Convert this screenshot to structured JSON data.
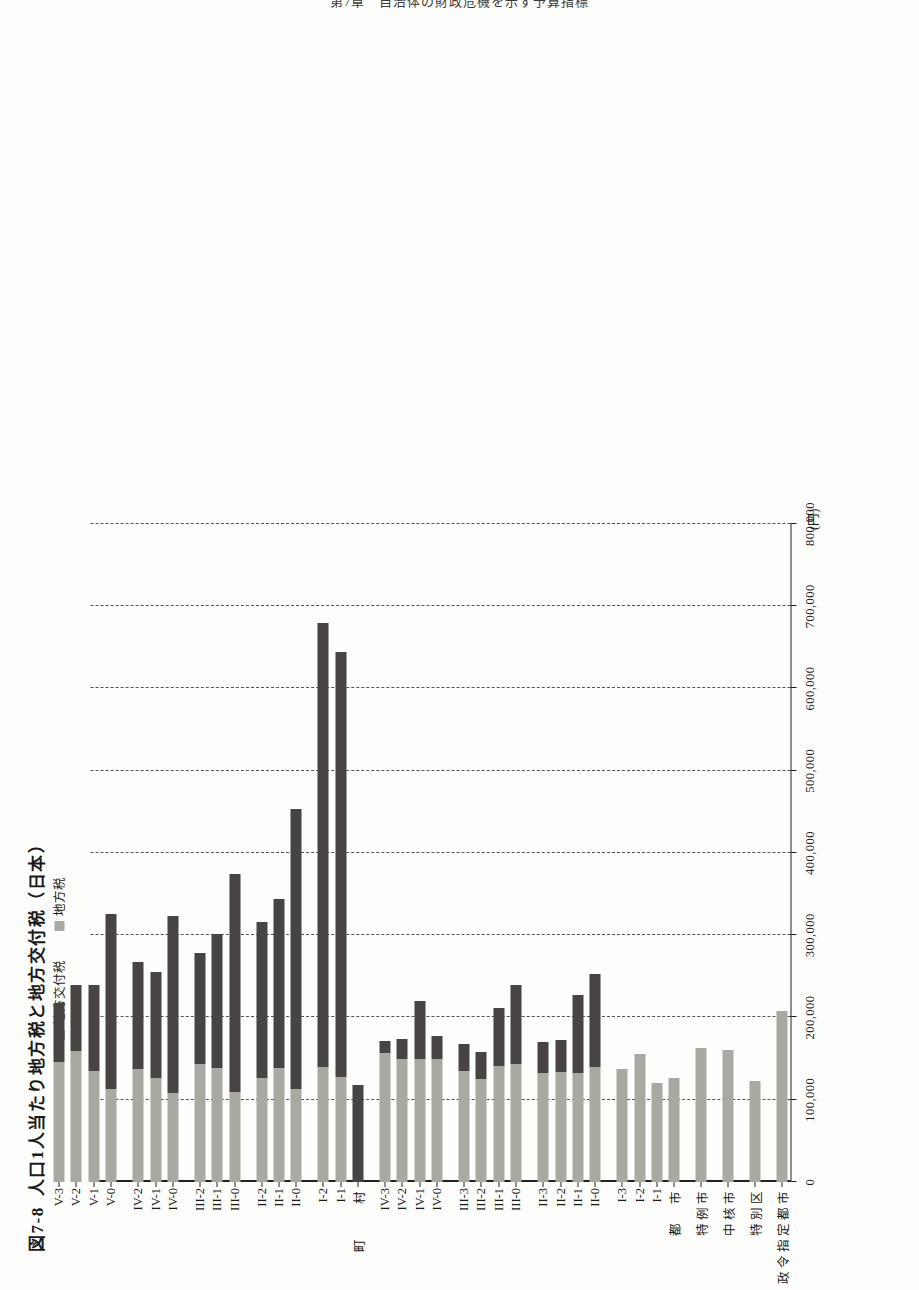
{
  "page": {
    "running_head": "第7章　自治体の財政危機を示す予算指標"
  },
  "figure": {
    "number": "図7-8",
    "title": "人口1人当たり地方税と地方交付税（日本）",
    "unit_label": "(円)"
  },
  "legend": {
    "position": "top-left",
    "items": [
      {
        "key": "grant",
        "label": "地方交付税",
        "color": "#474442"
      },
      {
        "key": "tax",
        "label": "地方税",
        "color": "#a9a9a4"
      }
    ]
  },
  "axis": {
    "value_ticks": [
      "0",
      "100,000",
      "200,000",
      "300,000",
      "400,000",
      "500,000",
      "600,000",
      "700,000",
      "800,000"
    ],
    "value_min": 0,
    "value_max": 800000,
    "value_step": 100000,
    "grid": "dashed"
  },
  "group_labels": [
    {
      "label": "政令指定都市",
      "at": 0
    },
    {
      "label": "特別区",
      "at": 1
    },
    {
      "label": "中核市",
      "at": 2
    },
    {
      "label": "特例市",
      "at": 3
    },
    {
      "label": "都　市",
      "at": 4
    },
    {
      "label": "町　　村",
      "at": 20
    }
  ],
  "chart_data": {
    "type": "bar",
    "orientation": "horizontal-stacked",
    "title": "人口1人当たり地方税と地方交付税（日本）",
    "xlabel": "",
    "ylabel": "(円)",
    "xlim": [
      0,
      800000
    ],
    "grid": true,
    "legend_position": "top-left",
    "series": [
      {
        "name": "地方税",
        "key": "tax",
        "color": "#a9a9a4"
      },
      {
        "name": "地方交付税",
        "key": "grant",
        "color": "#474442"
      }
    ],
    "categories": [
      "政令指定都市",
      "特別区",
      "中核市",
      "特例市",
      "I-0",
      "I-1",
      "I-2",
      "I-3",
      "II-0",
      "II-1",
      "II-2",
      "II-3",
      "III-0",
      "III-1",
      "III-2",
      "III-3",
      "IV-0",
      "IV-1",
      "IV-2",
      "IV-3",
      "I-0 ",
      "I-1 ",
      "I-2 ",
      "II-0 ",
      "II-1 ",
      "II-2 ",
      "III-0 ",
      "III-1 ",
      "III-2 ",
      "IV-0 ",
      "IV-1 ",
      "IV-2 ",
      "V-0",
      "V-1",
      "V-2",
      "V-3"
    ],
    "rows": [
      {
        "category": "政令指定都市",
        "tax": 208000,
        "grant": 0,
        "total": 208000,
        "group": "designated-city"
      },
      {
        "category": "特別区",
        "tax": 123000,
        "grant": 0,
        "total": 123000,
        "group": "special-ward"
      },
      {
        "category": "中核市",
        "tax": 161000,
        "grant": 0,
        "total": 161000,
        "group": "core-city"
      },
      {
        "category": "特例市",
        "tax": 163000,
        "grant": 0,
        "total": 163000,
        "group": "special-case-city"
      },
      {
        "category": "I-0",
        "tax": 127000,
        "grant": 0,
        "total": 127000,
        "group": "city"
      },
      {
        "category": "I-1",
        "tax": 120000,
        "grant": 0,
        "total": 120000,
        "group": "city"
      },
      {
        "category": "I-2",
        "tax": 156000,
        "grant": 0,
        "total": 156000,
        "group": "city"
      },
      {
        "category": "I-3",
        "tax": 137000,
        "grant": 0,
        "total": 137000,
        "group": "city"
      },
      {
        "category": "II-0",
        "tax": 140000,
        "grant": 113000,
        "total": 253000,
        "group": "city"
      },
      {
        "category": "II-1",
        "tax": 133000,
        "grant": 94000,
        "total": 227000,
        "group": "city"
      },
      {
        "category": "II-2",
        "tax": 134000,
        "grant": 39000,
        "total": 173000,
        "group": "city"
      },
      {
        "category": "II-3",
        "tax": 133000,
        "grant": 37000,
        "total": 170000,
        "group": "city"
      },
      {
        "category": "III-0",
        "tax": 143000,
        "grant": 96000,
        "total": 239000,
        "group": "city"
      },
      {
        "category": "III-1",
        "tax": 141000,
        "grant": 71000,
        "total": 212000,
        "group": "city"
      },
      {
        "category": "III-2",
        "tax": 125000,
        "grant": 33000,
        "total": 158000,
        "group": "city"
      },
      {
        "category": "III-3",
        "tax": 135000,
        "grant": 33000,
        "total": 168000,
        "group": "city"
      },
      {
        "category": "IV-0",
        "tax": 150000,
        "grant": 28000,
        "total": 178000,
        "group": "city"
      },
      {
        "category": "IV-1",
        "tax": 150000,
        "grant": 70000,
        "total": 220000,
        "group": "city"
      },
      {
        "category": "IV-2",
        "tax": 150000,
        "grant": 24000,
        "total": 174000,
        "group": "city"
      },
      {
        "category": "IV-3",
        "tax": 157000,
        "grant": 15000,
        "total": 172000,
        "group": "city"
      },
      {
        "category": "I-0",
        "tax": 0,
        "grant": 118000,
        "total": 118000,
        "group": "town-village"
      },
      {
        "category": "I-1",
        "tax": 128000,
        "grant": 517000,
        "total": 645000,
        "group": "town-village"
      },
      {
        "category": "I-2",
        "tax": 140000,
        "grant": 540000,
        "total": 680000,
        "group": "town-village"
      },
      {
        "category": "II-0",
        "tax": 113000,
        "grant": 340000,
        "total": 453000,
        "group": "town-village"
      },
      {
        "category": "II-1",
        "tax": 139000,
        "grant": 205000,
        "total": 344000,
        "group": "town-village"
      },
      {
        "category": "II-2",
        "tax": 126000,
        "grant": 190000,
        "total": 316000,
        "group": "town-village"
      },
      {
        "category": "III-0",
        "tax": 110000,
        "grant": 265000,
        "total": 375000,
        "group": "town-village"
      },
      {
        "category": "III-1",
        "tax": 138000,
        "grant": 163000,
        "total": 301000,
        "group": "town-village"
      },
      {
        "category": "III-2",
        "tax": 144000,
        "grant": 135000,
        "total": 279000,
        "group": "town-village"
      },
      {
        "category": "IV-0",
        "tax": 108000,
        "grant": 215000,
        "total": 323000,
        "group": "town-village"
      },
      {
        "category": "IV-1",
        "tax": 127000,
        "grant": 128000,
        "total": 255000,
        "group": "town-village"
      },
      {
        "category": "IV-2",
        "tax": 137000,
        "grant": 130000,
        "total": 267000,
        "group": "town-village"
      },
      {
        "category": "V-0",
        "tax": 113000,
        "grant": 213000,
        "total": 326000,
        "group": "town-village"
      },
      {
        "category": "V-1",
        "tax": 135000,
        "grant": 105000,
        "total": 240000,
        "group": "town-village"
      },
      {
        "category": "V-2",
        "tax": 159000,
        "grant": 80000,
        "total": 239000,
        "group": "town-village"
      },
      {
        "category": "V-3",
        "tax": 146000,
        "grant": 72000,
        "total": 218000,
        "group": "town-village"
      }
    ]
  }
}
